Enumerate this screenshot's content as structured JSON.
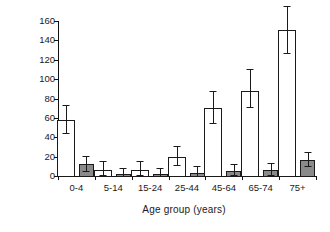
{
  "chart_data": {
    "type": "bar",
    "title": "",
    "xlabel": "Age group (years)",
    "ylabel": "Rate per 10000",
    "categories": [
      "0-4",
      "5-14",
      "15-24",
      "25-44",
      "45-64",
      "65-74",
      "75+"
    ],
    "ylim": [
      0,
      160
    ],
    "yticks": [
      0,
      20,
      40,
      60,
      80,
      100,
      120,
      140,
      160
    ],
    "ytick_labels": [
      "0",
      "20",
      "40",
      "60",
      "80",
      "100",
      "120",
      "140",
      "160"
    ],
    "grid": false,
    "legend": "none",
    "series": [
      {
        "name": "open-bars",
        "style": "open",
        "color": "#ffffff",
        "edge_color": "#1a1a1a",
        "values": [
          58,
          6,
          6,
          20,
          70,
          88,
          151
        ],
        "err_low": [
          44,
          1,
          1,
          11,
          55,
          71,
          127
        ],
        "err_high": [
          73,
          16,
          16,
          31,
          88,
          110,
          175
        ]
      },
      {
        "name": "filled-bars",
        "style": "filled",
        "color": "#8a8a8a",
        "edge_color": "#1a1a1a",
        "values": [
          12.5,
          2.5,
          2.5,
          3.5,
          5.5,
          6.5,
          17
        ],
        "err_low": [
          5,
          0,
          0,
          0,
          1,
          1,
          10
        ],
        "err_high": [
          21,
          8,
          8,
          10,
          12,
          13,
          25
        ]
      }
    ]
  }
}
